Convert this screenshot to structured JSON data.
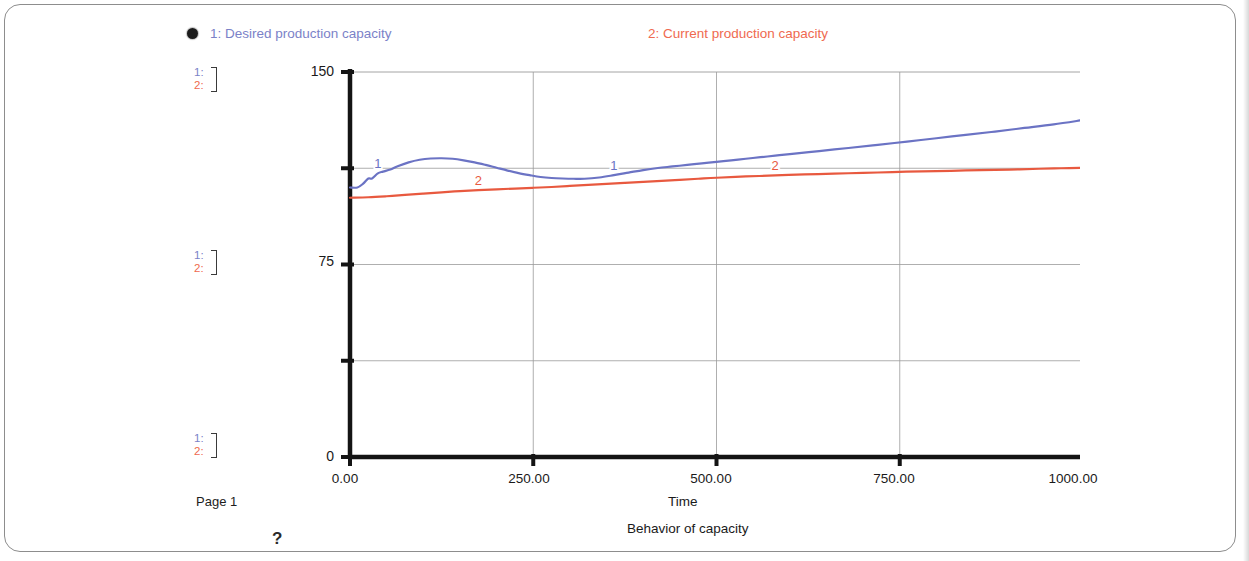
{
  "page": {
    "page_number_label": "Page 1",
    "help_glyph": "?"
  },
  "legend": {
    "marker_icon": "filled-circle-marker",
    "entries": [
      {
        "label": "1: Desired production  capacity",
        "color": "#7b82c8"
      },
      {
        "label": "2: Current production capacity",
        "color": "#ef6a50"
      }
    ]
  },
  "scale_stacks": [
    {
      "series_1": "1:",
      "series_2": "2:"
    },
    {
      "series_1": "1:",
      "series_2": "2:"
    },
    {
      "series_1": "1:",
      "series_2": "2:"
    }
  ],
  "axes": {
    "y_tick_labels": [
      "150",
      "75",
      "0"
    ],
    "x_tick_labels": [
      "0.00",
      "250.00",
      "500.00",
      "750.00",
      "1000.00"
    ],
    "x_title": "Time",
    "caption": "Behavior of capacity"
  },
  "chart_data": {
    "type": "line",
    "title": "Behavior of capacity",
    "xlabel": "Time",
    "ylabel": "",
    "xlim": [
      0,
      1000
    ],
    "ylim": [
      0,
      150
    ],
    "x_ticks": [
      0,
      250,
      500,
      750,
      1000
    ],
    "y_ticks": [
      0,
      37.5,
      75,
      112.5,
      150
    ],
    "y_tick_labels_shown": [
      0,
      75,
      150
    ],
    "grid": true,
    "legend_position": "top",
    "series": [
      {
        "name": "1: Desired production  capacity",
        "number": 1,
        "color": "#6b73c4",
        "inline_labels": [
          "1",
          "1"
        ],
        "x": [
          0,
          10,
          18,
          25,
          30,
          38,
          45,
          55,
          65,
          80,
          95,
          110,
          125,
          140,
          155,
          170,
          185,
          200,
          215,
          230,
          245,
          260,
          275,
          290,
          305,
          320,
          340,
          360,
          380,
          400,
          420,
          440,
          460,
          480,
          500,
          520,
          540,
          560,
          580,
          600,
          640,
          680,
          720,
          760,
          800,
          840,
          880,
          920,
          960,
          1000
        ],
        "y": [
          105.0,
          105.0,
          106.5,
          108.5,
          108.5,
          110.5,
          111.2,
          112.0,
          113.3,
          114.8,
          115.8,
          116.3,
          116.4,
          116.2,
          115.6,
          114.8,
          113.8,
          112.7,
          111.6,
          110.6,
          109.8,
          109.1,
          108.7,
          108.5,
          108.4,
          108.4,
          108.9,
          109.8,
          110.8,
          111.8,
          112.6,
          113.2,
          113.8,
          114.4,
          115.0,
          115.6,
          116.2,
          116.8,
          117.4,
          118.0,
          119.2,
          120.4,
          121.6,
          122.9,
          124.2,
          125.5,
          126.8,
          128.2,
          129.6,
          131.3
        ]
      },
      {
        "name": "2: Current production capacity",
        "number": 2,
        "color": "#e8593f",
        "inline_labels": [
          "2",
          "2"
        ],
        "x": [
          0,
          25,
          50,
          75,
          100,
          125,
          150,
          175,
          200,
          225,
          250,
          275,
          300,
          325,
          350,
          375,
          400,
          425,
          450,
          475,
          500,
          540,
          580,
          620,
          660,
          700,
          740,
          780,
          820,
          860,
          900,
          940,
          970,
          1000
        ],
        "y": [
          101.0,
          101.2,
          101.6,
          102.1,
          102.6,
          103.1,
          103.6,
          104.0,
          104.3,
          104.6,
          104.9,
          105.2,
          105.6,
          106.0,
          106.4,
          106.8,
          107.2,
          107.6,
          108.0,
          108.4,
          108.8,
          109.3,
          109.7,
          110.1,
          110.4,
          110.7,
          111.0,
          111.3,
          111.5,
          111.8,
          112.0,
          112.3,
          112.5,
          112.7
        ]
      }
    ]
  }
}
